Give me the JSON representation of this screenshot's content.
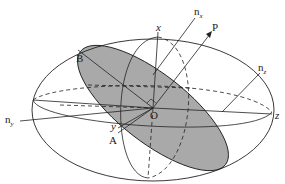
{
  "diagram": {
    "type": "index-ellipsoid",
    "colors": {
      "background": "#ffffff",
      "line": "#222222",
      "shaded_section": "#a9a9a9"
    },
    "labels": {
      "nx": {
        "base": "n",
        "sub": "x"
      },
      "ny": {
        "base": "n",
        "sub": "y"
      },
      "nz": {
        "base": "n",
        "sub": "z"
      },
      "P": "P",
      "x": "x",
      "y": "y",
      "z": "z",
      "O": "O",
      "A": "A",
      "B": "B"
    }
  }
}
